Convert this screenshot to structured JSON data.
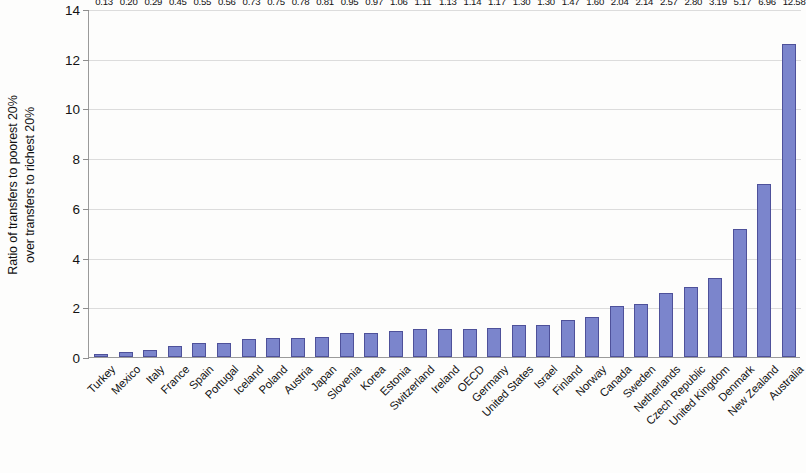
{
  "chart_data": {
    "type": "bar",
    "title": "",
    "xlabel": "",
    "ylabel": "Ratio of transfers to poorest 20% over transfers to richest 20%",
    "ylabel_lines": [
      "Ratio of transfers to poorest 20%",
      "over transfers to richest 20%"
    ],
    "ylim": [
      0,
      14
    ],
    "yticks": [
      0,
      2,
      4,
      6,
      8,
      10,
      12,
      14
    ],
    "ytick_labels": [
      "0",
      "2",
      "4",
      "6",
      "8",
      "10",
      "12",
      "14"
    ],
    "grid": true,
    "legend": false,
    "bar_color": "#7b85cc",
    "bar_border_color": "#4e519a",
    "categories": [
      "Turkey",
      "Mexico",
      "Italy",
      "France",
      "Spain",
      "Portugal",
      "Iceland",
      "Poland",
      "Austria",
      "Japan",
      "Slovenia",
      "Korea",
      "Estonia",
      "Switzerland",
      "Ireland",
      "OECD",
      "Germany",
      "United States",
      "Israel",
      "Finland",
      "Norway",
      "Canada",
      "Sweden",
      "Netherlands",
      "Czech Republic",
      "United Kingdom",
      "Denmark",
      "New Zealand",
      "Australia"
    ],
    "values": [
      0.13,
      0.2,
      0.29,
      0.45,
      0.55,
      0.56,
      0.73,
      0.75,
      0.78,
      0.81,
      0.95,
      0.97,
      1.06,
      1.11,
      1.13,
      1.14,
      1.17,
      1.3,
      1.3,
      1.47,
      1.6,
      2.04,
      2.14,
      2.57,
      2.8,
      3.19,
      5.17,
      6.96,
      12.58
    ],
    "value_labels": [
      "0.13",
      "0.20",
      "0.29",
      "0.45",
      "0.55",
      "0.56",
      "0.73",
      "0.75",
      "0.78",
      "0.81",
      "0.95",
      "0.97",
      "1.06",
      "1.11",
      "1.13",
      "1.14",
      "1.17",
      "1.30",
      "1.30",
      "1.47",
      "1.60",
      "2.04",
      "2.14",
      "2.57",
      "2.80",
      "3.19",
      "5.17",
      "6.96",
      "12.58"
    ]
  }
}
